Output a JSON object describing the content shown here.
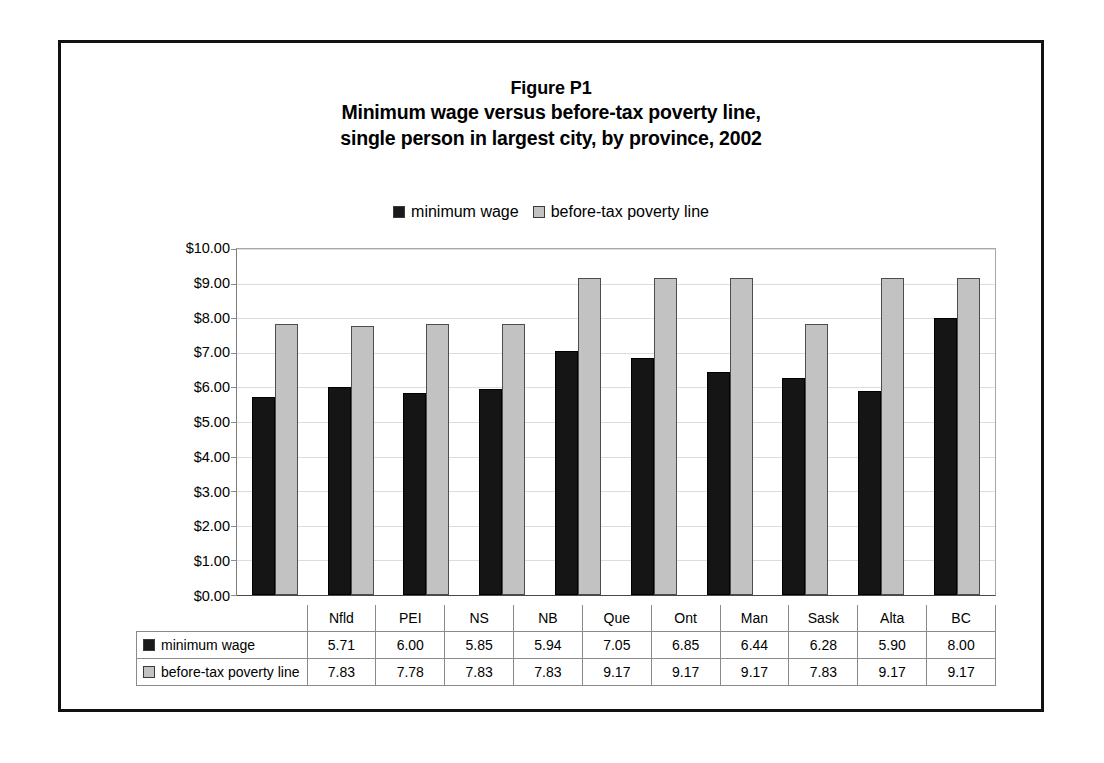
{
  "figure": {
    "title_line1": "Figure P1",
    "title_line2": "Minimum wage versus before-tax poverty line,",
    "title_line3": "single person in largest city, by province, 2002"
  },
  "legend": {
    "entries": [
      {
        "label": "minimum wage",
        "color": "#151515"
      },
      {
        "label": "before-tax poverty line",
        "color": "#c2c2c2"
      }
    ]
  },
  "chart_data": {
    "type": "bar",
    "xlabel": "",
    "ylabel": "",
    "ylim": [
      0,
      10
    ],
    "ytick_labels": [
      "$0.00",
      "$1.00",
      "$2.00",
      "$3.00",
      "$4.00",
      "$5.00",
      "$6.00",
      "$7.00",
      "$8.00",
      "$9.00",
      "$10.00"
    ],
    "ytick_values": [
      0,
      1,
      2,
      3,
      4,
      5,
      6,
      7,
      8,
      9,
      10
    ],
    "grid": true,
    "legend_position": "top-center",
    "categories": [
      "Nfld",
      "PEI",
      "NS",
      "NB",
      "Que",
      "Ont",
      "Man",
      "Sask",
      "Alta",
      "BC"
    ],
    "series": [
      {
        "name": "minimum wage",
        "color": "#151515",
        "values": [
          5.71,
          6.0,
          5.85,
          5.94,
          7.05,
          6.85,
          6.44,
          6.28,
          5.9,
          8.0
        ],
        "labels": [
          "5.71",
          "6.00",
          "5.85",
          "5.94",
          "7.05",
          "6.85",
          "6.44",
          "6.28",
          "5.90",
          "8.00"
        ]
      },
      {
        "name": "before-tax poverty line",
        "color": "#c2c2c2",
        "values": [
          7.83,
          7.78,
          7.83,
          7.83,
          9.17,
          9.17,
          9.17,
          7.83,
          9.17,
          9.17
        ],
        "labels": [
          "7.83",
          "7.78",
          "7.83",
          "7.83",
          "9.17",
          "9.17",
          "9.17",
          "7.83",
          "9.17",
          "9.17"
        ]
      }
    ]
  }
}
